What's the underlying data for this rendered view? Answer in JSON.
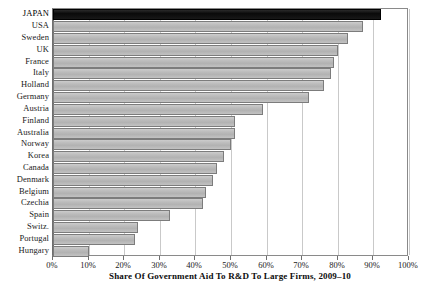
{
  "chart_data": {
    "type": "bar",
    "orientation": "horizontal",
    "title": "",
    "xlabel": "Share Of Government Aid To R&D To Large Firms, 2009–10",
    "ylabel": "",
    "xlim": [
      0,
      100
    ],
    "x_tick_labels": [
      "0%",
      "10%",
      "20%",
      "30%",
      "40%",
      "50%",
      "60%",
      "70%",
      "80%",
      "90%",
      "100%"
    ],
    "x_tick_values": [
      0,
      10,
      20,
      30,
      40,
      50,
      60,
      70,
      80,
      90,
      100
    ],
    "grid": "vertical",
    "legend": "none",
    "highlight_category": "JAPAN",
    "categories": [
      "JAPAN",
      "USA",
      "Sweden",
      "UK",
      "France",
      "Italy",
      "Holland",
      "Germany",
      "Austria",
      "Finland",
      "Australia",
      "Norway",
      "Korea",
      "Canada",
      "Denmark",
      "Belgium",
      "Czechia",
      "Spain",
      "Switz.",
      "Portugal",
      "Hungary"
    ],
    "values": [
      92,
      87,
      83,
      80,
      79,
      78,
      76,
      72,
      59,
      51,
      51,
      50,
      48,
      46,
      45,
      43,
      42,
      33,
      24,
      23,
      10
    ],
    "bars": [
      {
        "label": "JAPAN",
        "value": 92,
        "highlight": true
      },
      {
        "label": "USA",
        "value": 87,
        "highlight": false
      },
      {
        "label": "Sweden",
        "value": 83,
        "highlight": false
      },
      {
        "label": "UK",
        "value": 80,
        "highlight": false
      },
      {
        "label": "France",
        "value": 79,
        "highlight": false
      },
      {
        "label": "Italy",
        "value": 78,
        "highlight": false
      },
      {
        "label": "Holland",
        "value": 76,
        "highlight": false
      },
      {
        "label": "Germany",
        "value": 72,
        "highlight": false
      },
      {
        "label": "Austria",
        "value": 59,
        "highlight": false
      },
      {
        "label": "Finland",
        "value": 51,
        "highlight": false
      },
      {
        "label": "Australia",
        "value": 51,
        "highlight": false
      },
      {
        "label": "Norway",
        "value": 50,
        "highlight": false
      },
      {
        "label": "Korea",
        "value": 48,
        "highlight": false
      },
      {
        "label": "Canada",
        "value": 46,
        "highlight": false
      },
      {
        "label": "Denmark",
        "value": 45,
        "highlight": false
      },
      {
        "label": "Belgium",
        "value": 43,
        "highlight": false
      },
      {
        "label": "Czechia",
        "value": 42,
        "highlight": false
      },
      {
        "label": "Spain",
        "value": 33,
        "highlight": false
      },
      {
        "label": "Switz.",
        "value": 24,
        "highlight": false
      },
      {
        "label": "Portugal",
        "value": 23,
        "highlight": false
      },
      {
        "label": "Hungary",
        "value": 10,
        "highlight": false
      }
    ],
    "colors": {
      "bar_fill": "#b9b9b9",
      "bar_border": "#7c7c7c",
      "highlight_fill": "#121212",
      "highlight_border": "#000000",
      "gridline": "#c9c9c9",
      "axis": "#6e6e6e",
      "text": "#1a1a1a",
      "background": "#ffffff"
    }
  }
}
